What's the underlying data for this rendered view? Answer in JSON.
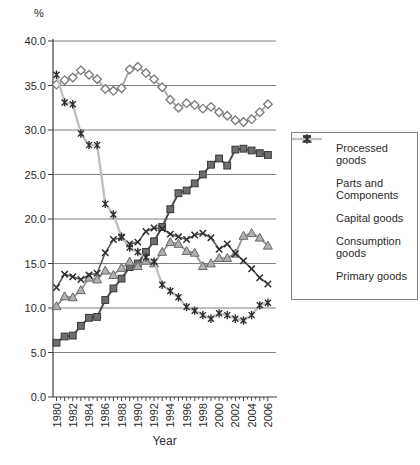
{
  "figure": {
    "background": "#ffffff",
    "axis_color": "#3f3f3f",
    "grid_color": "#7f7f7f",
    "text_color": "#2b2b2b"
  },
  "chart_data": {
    "type": "line",
    "title": "",
    "ylabel": "%",
    "xlabel": "Year",
    "ylim": [
      0.0,
      40.0
    ],
    "grid": "horizontal-on",
    "legend_position": "right-outside",
    "y_ticks": [
      0,
      5,
      10,
      15,
      20,
      25,
      30,
      35,
      40
    ],
    "y_tick_labels": [
      "0.0",
      "5.0",
      "10.0",
      "15.0",
      "20.0",
      "25.0",
      "30.0",
      "35.0",
      "40.0"
    ],
    "x": [
      1980,
      1981,
      1982,
      1983,
      1984,
      1985,
      1986,
      1987,
      1988,
      1989,
      1990,
      1991,
      1992,
      1993,
      1994,
      1995,
      1996,
      1997,
      1998,
      1999,
      2000,
      2001,
      2002,
      2003,
      2004,
      2005,
      2006
    ],
    "x_tick_labels": [
      "1980",
      "1982",
      "1984",
      "1986",
      "1988",
      "1990",
      "1992",
      "1994",
      "1996",
      "1998",
      "2000",
      "2002",
      "2004",
      "2006"
    ],
    "series": [
      {
        "name": "Processed goods",
        "marker": "diamond",
        "line_color": "#a9a9a9",
        "marker_fill": "#ffffff",
        "marker_stroke": "#7a7a7a",
        "line_width": 1.8,
        "values": [
          35.1,
          35.6,
          35.9,
          36.7,
          36.2,
          35.7,
          34.6,
          34.4,
          34.7,
          36.8,
          37.1,
          36.4,
          35.7,
          34.8,
          33.4,
          32.5,
          33.0,
          32.8,
          32.4,
          32.6,
          32.0,
          31.6,
          31.1,
          30.9,
          31.2,
          32.0,
          32.9
        ]
      },
      {
        "name": "Parts and Components",
        "marker": "square",
        "line_color": "#4f4f4f",
        "marker_fill": "#6e6e6e",
        "marker_stroke": "#383838",
        "line_width": 2.0,
        "values": [
          6.1,
          6.8,
          6.9,
          8.0,
          8.9,
          9.0,
          10.9,
          12.2,
          13.3,
          14.6,
          15.0,
          16.3,
          17.5,
          19.1,
          21.1,
          22.9,
          23.2,
          24.0,
          25.0,
          26.1,
          26.8,
          26.0,
          27.8,
          27.9,
          27.7,
          27.4,
          27.2
        ]
      },
      {
        "name": "Capital goods",
        "marker": "triangle",
        "line_color": "#9c9c9c",
        "marker_fill": "#b0b0b0",
        "marker_stroke": "#686868",
        "line_width": 2.0,
        "values": [
          10.2,
          11.3,
          11.2,
          12.0,
          13.4,
          13.2,
          14.2,
          13.7,
          14.5,
          15.2,
          14.7,
          15.3,
          15.0,
          16.3,
          17.4,
          17.2,
          16.4,
          16.2,
          14.7,
          15.0,
          15.6,
          15.6,
          16.1,
          18.1,
          18.4,
          17.9,
          17.0
        ]
      },
      {
        "name": "Consumption goods",
        "marker": "x",
        "line_color": "#585858",
        "marker_fill": "none",
        "marker_stroke": "#2d2d2d",
        "line_width": 1.6,
        "values": [
          12.3,
          13.8,
          13.5,
          13.2,
          13.7,
          13.9,
          16.2,
          17.7,
          17.9,
          17.2,
          17.4,
          18.6,
          19.0,
          18.9,
          18.3,
          18.0,
          17.7,
          18.2,
          18.4,
          17.9,
          16.6,
          17.2,
          16.1,
          15.3,
          14.4,
          13.4,
          12.7
        ]
      },
      {
        "name": "Primary goods",
        "marker": "asterisk",
        "line_color": "#c0c0c0",
        "marker_fill": "none",
        "marker_stroke": "#2d2d2d",
        "line_width": 2.4,
        "values": [
          36.2,
          33.1,
          32.9,
          29.6,
          28.3,
          28.3,
          21.7,
          20.5,
          18.0,
          16.8,
          16.3,
          15.7,
          15.2,
          12.6,
          11.9,
          11.2,
          10.1,
          9.7,
          9.2,
          8.8,
          9.4,
          9.2,
          8.8,
          8.6,
          9.2,
          10.3,
          10.6
        ]
      }
    ]
  }
}
